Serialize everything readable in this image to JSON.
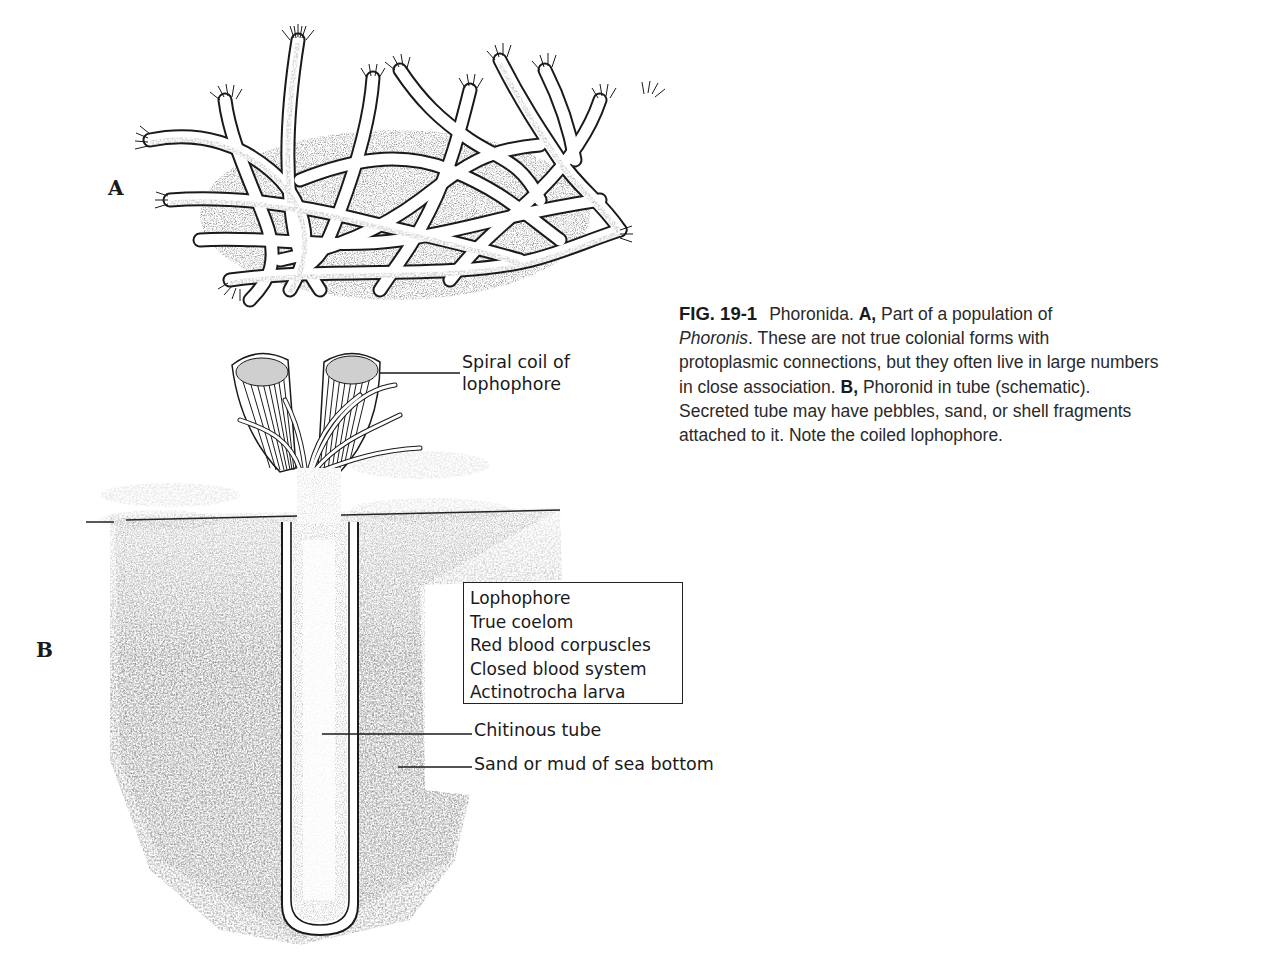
{
  "figure": {
    "number": "FIG. 19-1",
    "panel_labels": {
      "a": "A",
      "b": "B"
    },
    "caption": {
      "title": "Phoronida.",
      "lines": [
        {
          "bold_prefix": "A,",
          "text": "Part of a population of"
        },
        {
          "italic_prefix": "Phoronis",
          "text": ". These are not true colonial forms with"
        },
        {
          "text": "protoplasmic connections, but they often live in large numbers"
        },
        {
          "text_before": "in close association.",
          "bold_prefix": "B,",
          "text": "Phoronid in tube (schematic)."
        },
        {
          "text": "Secreted tube may have pebbles, sand, or shell fragments"
        },
        {
          "text": "attached to it. Note the coiled lophophore."
        }
      ]
    },
    "panel_a": {
      "description": "Tangled mass of tubes of a Phoronis population with tentacle crowns"
    },
    "panel_b": {
      "description": "Phoronid in tube (schematic) buried in sea bottom",
      "callouts": {
        "spiral_line1": "Spiral coil of",
        "spiral_line2": "lophophore",
        "chitinous_tube": "Chitinous tube",
        "sand": "Sand or mud of sea bottom"
      },
      "traits": [
        "Lophophore",
        "True coelom",
        "Red blood corpuscles",
        "Closed blood system",
        "Actinotrocha larva"
      ]
    }
  },
  "colors": {
    "ink": "#1a1a1a",
    "sediment": "#8a8a8a",
    "background": "#ffffff"
  }
}
